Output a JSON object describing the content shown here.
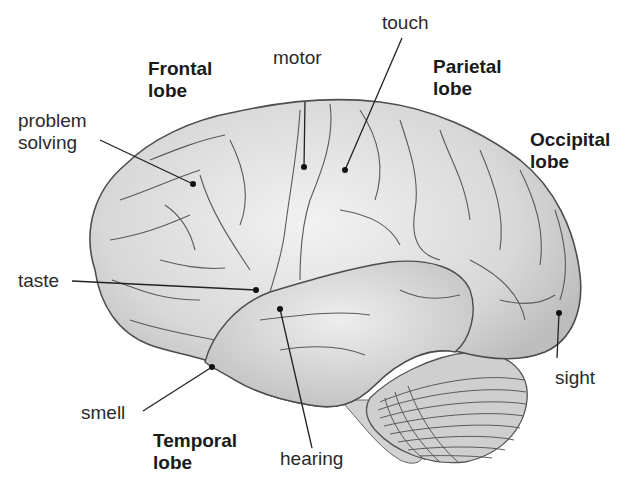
{
  "diagram": {
    "lobes": [
      {
        "id": "frontal",
        "line1": "Frontal",
        "line2": "lobe"
      },
      {
        "id": "parietal",
        "line1": "Parietal",
        "line2": "lobe"
      },
      {
        "id": "occipital",
        "line1": "Occipital",
        "line2": "lobe"
      },
      {
        "id": "temporal",
        "line1": "Temporal",
        "line2": "lobe"
      }
    ],
    "functions": [
      {
        "id": "problem_solving",
        "line1": "problem",
        "line2": "solving"
      },
      {
        "id": "motor",
        "text": "motor"
      },
      {
        "id": "touch",
        "text": "touch"
      },
      {
        "id": "taste",
        "text": "taste"
      },
      {
        "id": "smell",
        "text": "smell"
      },
      {
        "id": "hearing",
        "text": "hearing"
      },
      {
        "id": "sight",
        "text": "sight"
      }
    ],
    "colors": {
      "brain_fill": "#d6d6d6",
      "brain_highlight": "#efefef",
      "outline": "#555555",
      "label_text": "#2a2a2a",
      "leader_line": "#222222"
    }
  }
}
